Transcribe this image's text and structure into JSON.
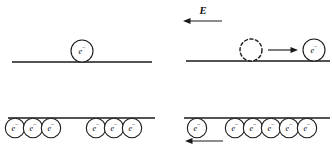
{
  "figure": {
    "background_color": "#ffffff",
    "ink_color": "#1a1a1a",
    "width": 332,
    "height": 150
  },
  "labels": {
    "electron": "e⁻",
    "electron_base": "e",
    "electron_sup": "−",
    "field": "E"
  },
  "panels": [
    {
      "id": "top-left",
      "name": "single-electron-at-rest",
      "line": {
        "x1": 12,
        "x2": 152,
        "y": 62
      },
      "electrons_above": [
        {
          "cx": 82,
          "cy": 51,
          "r": 11,
          "label": "e⁻"
        }
      ],
      "electrons_below": [],
      "vacancies": [],
      "arrows": []
    },
    {
      "id": "top-right",
      "name": "single-electron-drifting",
      "line": {
        "x1": 186,
        "x2": 330,
        "y": 61
      },
      "electrons_above": [
        {
          "cx": 314,
          "cy": 50,
          "r": 11,
          "label": "e⁻"
        }
      ],
      "electrons_below": [],
      "vacancies": [
        {
          "cx": 251,
          "cy": 50,
          "r": 11
        }
      ],
      "arrows": [
        {
          "name": "field-arrow",
          "x_tail": 222,
          "x_head": 183,
          "y": 21,
          "direction": "left",
          "label": "E",
          "label_x": 203,
          "label_y": 12
        },
        {
          "name": "motion-arrow",
          "x_tail": 268,
          "x_head": 298,
          "y": 50,
          "direction": "right",
          "label": "",
          "label_x": 0,
          "label_y": 0
        }
      ]
    },
    {
      "id": "bottom-left",
      "name": "electron-row-at-rest",
      "line": {
        "x1": 8,
        "x2": 155,
        "y": 118
      },
      "electrons_above": [],
      "electrons_below": [
        {
          "cx": 15,
          "cy": 128,
          "r": 9.7,
          "label": "e⁻"
        },
        {
          "cx": 33,
          "cy": 128,
          "r": 9.7,
          "label": "e⁻"
        },
        {
          "cx": 51,
          "cy": 128,
          "r": 9.7,
          "label": "e⁻"
        },
        {
          "cx": 96,
          "cy": 128,
          "r": 9.7,
          "label": "e⁻"
        },
        {
          "cx": 114,
          "cy": 128,
          "r": 9.7,
          "label": "e⁻"
        },
        {
          "cx": 132,
          "cy": 128,
          "r": 9.7,
          "label": "e⁻"
        }
      ],
      "vacancies": [],
      "arrows": []
    },
    {
      "id": "bottom-right",
      "name": "electron-row-drifting",
      "line": {
        "x1": 184,
        "x2": 330,
        "y": 118
      },
      "electrons_above": [],
      "electrons_below": [
        {
          "cx": 197,
          "cy": 128,
          "r": 9.7,
          "label": "e⁻"
        },
        {
          "cx": 235,
          "cy": 128,
          "r": 9.7,
          "label": "e⁻"
        },
        {
          "cx": 253,
          "cy": 128,
          "r": 9.7,
          "label": "e⁻"
        },
        {
          "cx": 271,
          "cy": 128,
          "r": 9.7,
          "label": "e⁻"
        },
        {
          "cx": 289,
          "cy": 128,
          "r": 9.7,
          "label": "e⁻"
        },
        {
          "cx": 307,
          "cy": 128,
          "r": 9.7,
          "label": "e⁻"
        }
      ],
      "vacancies": [],
      "arrows": [
        {
          "name": "drift-arrow",
          "x_tail": 223,
          "x_head": 185,
          "y": 141,
          "direction": "left",
          "label": "",
          "label_x": 0,
          "label_y": 0
        }
      ]
    }
  ]
}
